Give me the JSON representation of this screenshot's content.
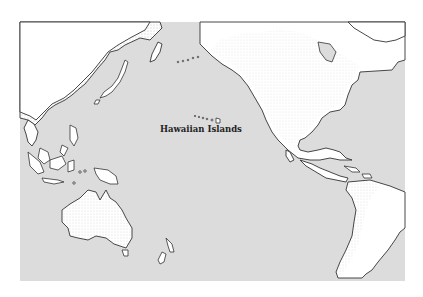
{
  "map": {
    "title": "Pacific Ocean",
    "colors": {
      "ocean": "#dcdcdc",
      "land": "#ffffff",
      "coastline": "#333333",
      "background": "#ffffff"
    },
    "labels": [
      {
        "id": "hawaiian-islands",
        "text": "Hawaiian Islands",
        "x": 160,
        "y": 129
      }
    ],
    "regions": [
      "Asia",
      "North America",
      "South America",
      "Australia",
      "New Zealand",
      "Indonesia",
      "Japan",
      "Alaska",
      "Hawaiian Islands"
    ]
  }
}
